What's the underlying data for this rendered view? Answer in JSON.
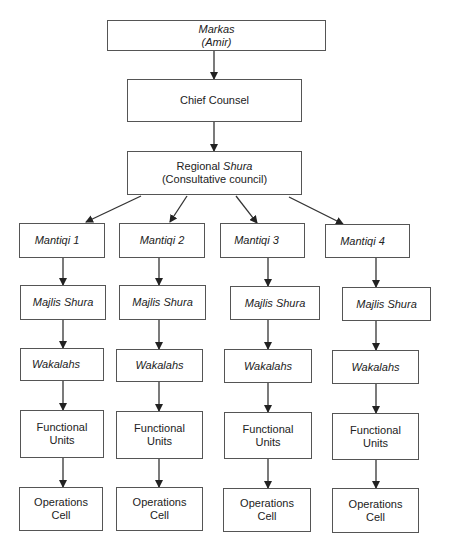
{
  "diagram": {
    "type": "organizational-chart",
    "top": {
      "markas": {
        "line1": "Markas",
        "line2": "(Amir)"
      },
      "chief_counsel": {
        "label": "Chief Counsel"
      },
      "regional_shura": {
        "line1_prefix": "Regional ",
        "line1_italic": "Shura",
        "line2": "(Consultative council)"
      }
    },
    "branches": [
      {
        "mantiqi": "Mantiqi 1",
        "majlis": "Majlis Shura",
        "wakalahs": "Wakalahs",
        "functional_1": "Functional",
        "functional_2": "Units",
        "ops_1": "Operations",
        "ops_2": "Cell"
      },
      {
        "mantiqi": "Mantiqi 2",
        "majlis": "Majlis Shura",
        "wakalahs": "Wakalahs",
        "functional_1": "Functional",
        "functional_2": "Units",
        "ops_1": "Operations",
        "ops_2": "Cell"
      },
      {
        "mantiqi": "Mantiqi 3",
        "majlis": "Majlis Shura",
        "wakalahs": "Wakalahs",
        "functional_1": "Functional",
        "functional_2": "Units",
        "ops_1": "Operations",
        "ops_2": "Cell"
      },
      {
        "mantiqi": "Mantiqi 4",
        "majlis": "Majlis Shura",
        "wakalahs": "Wakalahs",
        "functional_1": "Functional",
        "functional_2": "Units",
        "ops_1": "Operations",
        "ops_2": "Cell"
      }
    ]
  }
}
